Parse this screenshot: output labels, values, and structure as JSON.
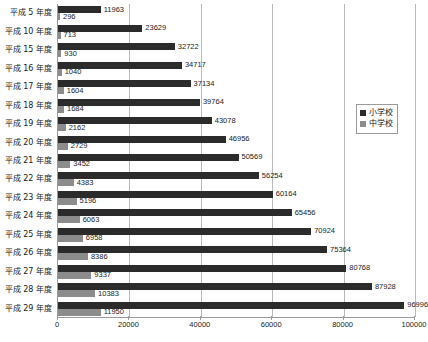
{
  "chart_data": {
    "type": "bar",
    "orientation": "horizontal",
    "title": "",
    "xlabel": "",
    "ylabel": "",
    "xlim": [
      0,
      100000
    ],
    "xticks": [
      0,
      20000,
      40000,
      60000,
      80000,
      100000
    ],
    "xtick_labels": [
      "0",
      "20000",
      "40000",
      "60000",
      "80000",
      "100000"
    ],
    "grid": "vertical",
    "legend_position": "right",
    "categories": [
      "平成 5 年度",
      "平成 10 年度",
      "平成 15 年度",
      "平成 16 年度",
      "平成 17 年度",
      "平成 18 年度",
      "平成 19 年度",
      "平成 20 年度",
      "平成 21 年度",
      "平成 22 年度",
      "平成 23 年度",
      "平成 24 年度",
      "平成 25 年度",
      "平成 26 年度",
      "平成 27 年度",
      "平成 28 年度",
      "平成 29 年度"
    ],
    "series": [
      {
        "name": "小学校",
        "color": "#2b2b2b",
        "values": [
          11963,
          23629,
          32722,
          34717,
          37134,
          39764,
          43078,
          46956,
          50569,
          56254,
          60164,
          65456,
          70924,
          75364,
          80768,
          87928,
          96996
        ]
      },
      {
        "name": "中学校",
        "color": "#8c8c8c",
        "values": [
          296,
          713,
          930,
          1040,
          1604,
          1684,
          2162,
          2729,
          3452,
          4383,
          5196,
          6063,
          6958,
          8386,
          9337,
          10383,
          11950
        ]
      }
    ]
  },
  "legend": {
    "items": [
      {
        "label": "小学校",
        "color": "#2b2b2b"
      },
      {
        "label": "中学校",
        "color": "#8c8c8c"
      }
    ]
  },
  "axis_colors": {
    "axis_line": "#9a9a9a",
    "gridline": "#b9b9b9",
    "text": "#1a1a1a"
  }
}
